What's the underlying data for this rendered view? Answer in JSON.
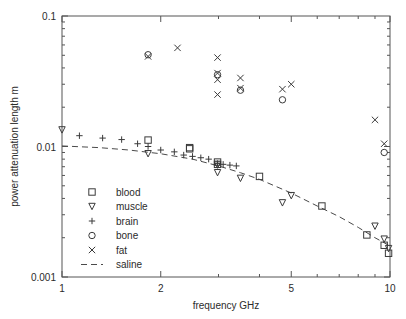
{
  "chart_data": {
    "type": "scatter",
    "title": "",
    "xlabel": "frequency GHz",
    "ylabel": "power attenuation length m",
    "xscale": "log",
    "yscale": "log",
    "xlim": [
      1,
      10
    ],
    "ylim": [
      0.001,
      0.1
    ],
    "xticks": [
      1,
      2,
      5,
      10
    ],
    "xticklabels": [
      "1",
      "2",
      "5",
      "10"
    ],
    "yticks": [
      0.001,
      0.01,
      0.1
    ],
    "yticklabels": [
      "0.001",
      "0.01",
      "0.1"
    ],
    "grid": false,
    "legend_position": "lower left",
    "series": [
      {
        "name": "blood",
        "marker": "square",
        "x": [
          1.83,
          2.45,
          2.45,
          2.98,
          2.98,
          4.0,
          6.2,
          8.5,
          9.6,
          9.9
        ],
        "y": [
          0.0112,
          0.0098,
          0.0096,
          0.0076,
          0.0073,
          0.0059,
          0.0035,
          0.0021,
          0.00175,
          0.00152
        ]
      },
      {
        "name": "muscle",
        "marker": "triangle-down",
        "x": [
          1.0,
          1.83,
          2.98,
          2.98,
          3.5,
          4.7,
          5.0,
          9.0,
          9.6,
          9.9
        ],
        "y": [
          0.0134,
          0.0088,
          0.0072,
          0.0063,
          0.0057,
          0.0037,
          0.0042,
          0.00245,
          0.00195,
          0.00165
        ]
      },
      {
        "name": "brain",
        "marker": "plus",
        "x": [
          1.13,
          1.33,
          1.52,
          1.7,
          1.83,
          2.0,
          2.2,
          2.35,
          2.5,
          2.65,
          2.8,
          2.98,
          3.1,
          3.25,
          3.4
        ],
        "y": [
          0.0121,
          0.0116,
          0.0113,
          0.0105,
          0.01,
          0.0094,
          0.0091,
          0.0086,
          0.0084,
          0.0082,
          0.008,
          0.0074,
          0.0073,
          0.0072,
          0.0071
        ]
      },
      {
        "name": "bone",
        "marker": "circle",
        "x": [
          1.83,
          2.98,
          3.5,
          4.7,
          9.6
        ],
        "y": [
          0.0505,
          0.0355,
          0.027,
          0.0228,
          0.009
        ]
      },
      {
        "name": "fat",
        "marker": "x",
        "x": [
          1.83,
          2.25,
          2.98,
          2.98,
          2.98,
          2.98,
          3.5,
          3.5,
          4.7,
          5.0,
          9.0,
          9.6
        ],
        "y": [
          0.049,
          0.057,
          0.048,
          0.0365,
          0.0325,
          0.025,
          0.0335,
          0.028,
          0.0275,
          0.03,
          0.016,
          0.0105
        ]
      },
      {
        "name": "saline",
        "marker": "none",
        "linestyle": "dashed",
        "x": [
          1.0,
          1.3,
          1.6,
          2.0,
          2.5,
          3.0,
          3.5,
          4.0,
          5.0,
          6.0,
          7.0,
          8.0,
          9.0,
          10.0
        ],
        "y": [
          0.0101,
          0.0098,
          0.0094,
          0.0088,
          0.008,
          0.0071,
          0.0063,
          0.0056,
          0.0044,
          0.0035,
          0.0029,
          0.0024,
          0.002,
          0.00173
        ]
      }
    ],
    "legend_entries": [
      {
        "label": "blood",
        "marker": "square"
      },
      {
        "label": "muscle",
        "marker": "triangle-down"
      },
      {
        "label": "brain",
        "marker": "plus"
      },
      {
        "label": "bone",
        "marker": "circle"
      },
      {
        "label": "fat",
        "marker": "x"
      },
      {
        "label": "saline",
        "marker": "dashed-line"
      }
    ],
    "colors": {
      "marker": "#3a3a3a",
      "axis": "#555555",
      "curve": "#4a4a4a",
      "background": "#ffffff"
    }
  }
}
